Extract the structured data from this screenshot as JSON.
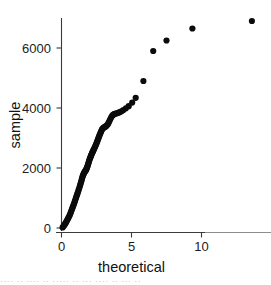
{
  "figure": {
    "background_color": "#ffffff",
    "point_color": "#0b0b0b",
    "axis_color": "#3a3a3a",
    "caption_sliver": "···· ·· ···· ·· ····· ·· ··· ···· ·· ··· ··"
  },
  "chart_data": {
    "type": "scatter",
    "title": "",
    "subtitle": "",
    "xlabel": "theoretical",
    "ylabel": "sample",
    "xlim": [
      -0.55,
      14.9
    ],
    "ylim": [
      -330,
      7250
    ],
    "xticks": [
      0,
      5,
      10
    ],
    "xticklabels": [
      "0",
      "5",
      "10"
    ],
    "yticks": [
      0,
      2000,
      4000,
      6000
    ],
    "yticklabels": [
      "0",
      "2000",
      "4000",
      "6000"
    ],
    "grid": false,
    "legend": null,
    "marker": "circle",
    "marker_size": 3.1,
    "series": [
      {
        "name": "quantile pairs",
        "x": [
          0.08,
          0.14,
          0.2,
          0.25,
          0.3,
          0.35,
          0.4,
          0.45,
          0.5,
          0.55,
          0.6,
          0.64,
          0.68,
          0.72,
          0.76,
          0.8,
          0.84,
          0.88,
          0.92,
          0.96,
          1.0,
          1.04,
          1.08,
          1.12,
          1.16,
          1.2,
          1.24,
          1.28,
          1.32,
          1.36,
          1.4,
          1.43,
          1.46,
          1.49,
          1.52,
          1.55,
          1.58,
          1.61,
          1.64,
          1.67,
          1.7,
          1.73,
          1.76,
          1.79,
          1.82,
          1.85,
          1.88,
          1.91,
          1.94,
          1.97,
          2.0,
          2.03,
          2.06,
          2.09,
          2.12,
          2.15,
          2.18,
          2.21,
          2.24,
          2.27,
          2.3,
          2.34,
          2.38,
          2.42,
          2.46,
          2.5,
          2.54,
          2.58,
          2.62,
          2.66,
          2.7,
          2.74,
          2.78,
          2.82,
          2.86,
          2.9,
          2.95,
          3.0,
          3.05,
          3.1,
          3.15,
          3.2,
          3.26,
          3.32,
          3.38,
          3.44,
          3.5,
          3.56,
          3.62,
          3.68,
          3.74,
          3.8,
          3.88,
          3.96,
          4.05,
          4.15,
          4.28,
          4.42,
          4.6,
          4.8,
          5.05,
          5.3,
          5.85,
          6.55,
          7.5,
          9.35,
          13.6
        ],
        "y": [
          20,
          55,
          95,
          130,
          170,
          210,
          255,
          300,
          345,
          390,
          440,
          490,
          540,
          590,
          640,
          690,
          740,
          790,
          845,
          900,
          955,
          1010,
          1065,
          1120,
          1175,
          1230,
          1290,
          1350,
          1410,
          1470,
          1530,
          1585,
          1640,
          1690,
          1730,
          1770,
          1800,
          1830,
          1855,
          1880,
          1900,
          1920,
          1945,
          1975,
          2010,
          2050,
          2095,
          2140,
          2185,
          2230,
          2275,
          2315,
          2350,
          2385,
          2420,
          2455,
          2490,
          2520,
          2550,
          2580,
          2610,
          2650,
          2690,
          2730,
          2775,
          2820,
          2870,
          2920,
          2970,
          3020,
          3070,
          3115,
          3160,
          3205,
          3250,
          3290,
          3320,
          3340,
          3355,
          3370,
          3385,
          3400,
          3430,
          3470,
          3520,
          3580,
          3640,
          3700,
          3740,
          3770,
          3790,
          3805,
          3815,
          3825,
          3840,
          3860,
          3890,
          3930,
          3990,
          4060,
          4180,
          4340,
          4900,
          5900,
          6250,
          6650,
          6900
        ]
      }
    ]
  }
}
